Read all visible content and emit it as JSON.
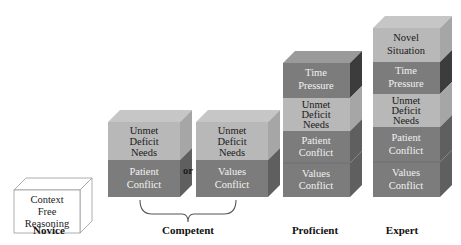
{
  "colors": {
    "light_block": "#b8b8b8",
    "dark_block": "#7c7c7c",
    "light_text": "#1a1a1a",
    "dark_text": "#f2f2f2",
    "outline": "#888888"
  },
  "stages": {
    "novice": {
      "label": "Novice",
      "blocks": [
        {
          "line1": "Context",
          "line2": "Free",
          "line3": "Reasoning"
        }
      ]
    },
    "competent": {
      "label": "Competent",
      "connector": "or",
      "option_a": {
        "top": {
          "line1": "Unmet",
          "line2": "Deficit",
          "line3": "Needs"
        },
        "bottom": {
          "line1": "Patient",
          "line2": "Conflict"
        }
      },
      "option_b": {
        "top": {
          "line1": "Unmet",
          "line2": "Deficit",
          "line3": "Needs"
        },
        "bottom": {
          "line1": "Values",
          "line2": "Conflict"
        }
      }
    },
    "proficient": {
      "label": "Proficient",
      "blocks": [
        {
          "line1": "Time",
          "line2": "Pressure"
        },
        {
          "line1": "Unmet",
          "line2": "Deficit",
          "line3": "Needs"
        },
        {
          "line1": "Patient",
          "line2": "Conflict"
        },
        {
          "line1": "Values",
          "line2": "Conflict"
        }
      ]
    },
    "expert": {
      "label": "Expert",
      "blocks": [
        {
          "line1": "Novel",
          "line2": "Situation"
        },
        {
          "line1": "Time",
          "line2": "Pressure"
        },
        {
          "line1": "Unmet",
          "line2": "Deficit",
          "line3": "Needs"
        },
        {
          "line1": "Patient",
          "line2": "Conflict"
        },
        {
          "line1": "Values",
          "line2": "Conflict"
        }
      ]
    }
  }
}
